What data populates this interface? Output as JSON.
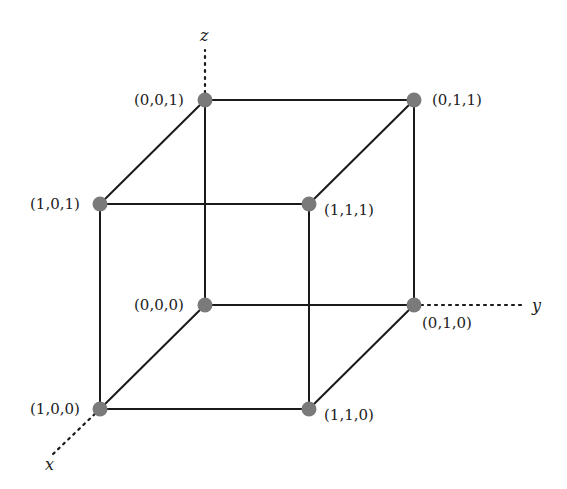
{
  "diagram": {
    "type": "unit-cube-boolean-lattice",
    "axes": [
      {
        "id": "x",
        "label": "x",
        "from": [
          100,
          409
        ],
        "to": [
          52,
          455
        ],
        "label_pos": [
          45,
          470
        ]
      },
      {
        "id": "y",
        "label": "y",
        "from": [
          414,
          305
        ],
        "to": [
          525,
          305
        ],
        "label_pos": [
          532,
          311
        ]
      },
      {
        "id": "z",
        "label": "z",
        "from": [
          205,
          100
        ],
        "to": [
          205,
          50
        ],
        "label_pos": [
          200,
          41
        ]
      }
    ],
    "vertices": [
      {
        "id": "v001",
        "label": "(0,0,1)",
        "x": 205,
        "y": 100,
        "label_x": 134,
        "label_y": 105
      },
      {
        "id": "v011",
        "label": "(0,1,1)",
        "x": 414,
        "y": 100,
        "label_x": 432,
        "label_y": 105
      },
      {
        "id": "v101",
        "label": "(1,0,1)",
        "x": 100,
        "y": 204,
        "label_x": 30,
        "label_y": 209
      },
      {
        "id": "v111",
        "label": "(1,1,1)",
        "x": 309,
        "y": 204,
        "label_x": 324,
        "label_y": 215
      },
      {
        "id": "v000",
        "label": "(0,0,0)",
        "x": 205,
        "y": 305,
        "label_x": 134,
        "label_y": 310
      },
      {
        "id": "v010",
        "label": "(0,1,0)",
        "x": 414,
        "y": 305,
        "label_x": 422,
        "label_y": 328
      },
      {
        "id": "v100",
        "label": "(1,0,0)",
        "x": 100,
        "y": 409,
        "label_x": 30,
        "label_y": 414
      },
      {
        "id": "v110",
        "label": "(1,1,0)",
        "x": 309,
        "y": 409,
        "label_x": 324,
        "label_y": 420
      }
    ],
    "edges": [
      [
        "v001",
        "v011"
      ],
      [
        "v001",
        "v101"
      ],
      [
        "v011",
        "v111"
      ],
      [
        "v101",
        "v111"
      ],
      [
        "v000",
        "v010"
      ],
      [
        "v000",
        "v100"
      ],
      [
        "v010",
        "v110"
      ],
      [
        "v100",
        "v110"
      ],
      [
        "v001",
        "v000"
      ],
      [
        "v011",
        "v010"
      ],
      [
        "v101",
        "v100"
      ],
      [
        "v111",
        "v110"
      ]
    ],
    "colors": {
      "vertex": "#7a7a7a",
      "edge": "#1a1a1a",
      "background": "#ffffff"
    }
  }
}
